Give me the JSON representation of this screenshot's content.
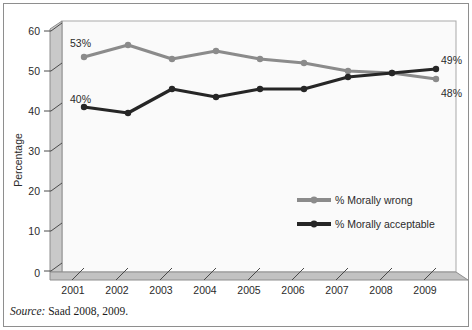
{
  "source_note": {
    "prefix": "Source:",
    "rest": " Saad 2008, 2009."
  },
  "axis": {
    "ylabel": "Percentage",
    "ytick_labels": [
      "0",
      "10",
      "20",
      "30",
      "40",
      "50",
      "60"
    ],
    "xtick_labels": [
      "2001",
      "2002",
      "2003",
      "2004",
      "2005",
      "2006",
      "2007",
      "2008",
      "2009"
    ]
  },
  "annotations": {
    "start_wrong": "53%",
    "start_acceptable": "40%",
    "end_acceptable": "49%",
    "end_wrong": "48%"
  },
  "legend": {
    "items": [
      {
        "label": "% Morally wrong",
        "color": "#8b8b8b"
      },
      {
        "label": "% Morally acceptable",
        "color": "#262626"
      }
    ]
  },
  "colors": {
    "morally_wrong": "#8b8b8b",
    "morally_acceptable": "#262626",
    "wall": "#c9c9c9",
    "wall_edge": "#8e8e8e",
    "plot_bg": "#fafafa",
    "frame": "#8e8e8e"
  },
  "chart_data": {
    "type": "line",
    "title": "",
    "xlabel": "",
    "ylabel": "Percentage",
    "x": [
      "2001",
      "2002",
      "2003",
      "2004",
      "2005",
      "2006",
      "2007",
      "2008",
      "2009"
    ],
    "ylim": [
      0,
      65
    ],
    "yticks": [
      0,
      10,
      20,
      30,
      40,
      50,
      60
    ],
    "grid": false,
    "legend_position": "center-right",
    "series": [
      {
        "name": "% Morally wrong",
        "color": "#8b8b8b",
        "values": [
          53.5,
          56.5,
          53.0,
          55.0,
          53.0,
          52.0,
          50.0,
          49.5,
          48.0
        ],
        "labels": {
          "2001": "53%",
          "2009": "48%"
        }
      },
      {
        "name": "% Morally acceptable",
        "color": "#262626",
        "values": [
          41.0,
          39.5,
          45.5,
          43.5,
          45.5,
          45.5,
          48.5,
          49.5,
          50.5
        ],
        "labels": {
          "2001": "40%",
          "2009": "49%"
        }
      }
    ]
  }
}
